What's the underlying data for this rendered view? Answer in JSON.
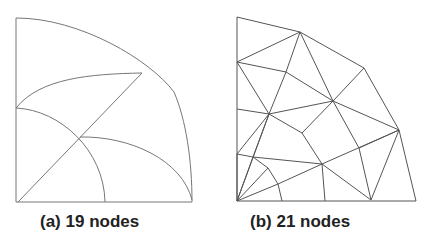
{
  "figures": [
    {
      "id": "a",
      "caption": "(a) 19 nodes",
      "type": "curved quadrant mesh",
      "stroke": "#777777",
      "lines": [
        "M16,18 L16,202",
        "M16,202 L192,202",
        "M16,18 C 80,18 150,60 174,92",
        "M174,92 C 186,120 192,160 192,202",
        "M18,202 L142,73",
        "M16,108 C 40,78 90,74 142,73",
        "M16,108 C 60,110 104,150 105,202",
        "M80,137 C 130,136 182,160 192,200"
      ]
    },
    {
      "id": "b",
      "caption": "(b) 21 nodes",
      "type": "triangular mesh",
      "stroke": "#555555",
      "nodes": {
        "A": [
          237,
          17
        ],
        "B": [
          300,
          32
        ],
        "C": [
          364,
          68
        ],
        "D": [
          399,
          130
        ],
        "E": [
          416,
          201
        ],
        "F": [
          237,
          201
        ],
        "G": [
          237,
          62
        ],
        "H": [
          286,
          72
        ],
        "I": [
          333,
          101
        ],
        "J": [
          269,
          114
        ],
        "K": [
          237,
          109
        ],
        "L": [
          302,
          133
        ],
        "M": [
          359,
          148
        ],
        "N": [
          237,
          154
        ],
        "O": [
          253,
          157
        ],
        "P": [
          268,
          168
        ],
        "Q": [
          322,
          164
        ],
        "R": [
          278,
          184
        ],
        "S": [
          282,
          201
        ],
        "T": [
          325,
          201
        ],
        "U": [
          371,
          200
        ]
      },
      "edges": [
        [
          "A",
          "B"
        ],
        [
          "B",
          "C"
        ],
        [
          "C",
          "D"
        ],
        [
          "D",
          "E"
        ],
        [
          "E",
          "F"
        ],
        [
          "F",
          "A"
        ],
        [
          "B",
          "G"
        ],
        [
          "B",
          "H"
        ],
        [
          "B",
          "I"
        ],
        [
          "G",
          "H"
        ],
        [
          "G",
          "J"
        ],
        [
          "H",
          "I"
        ],
        [
          "H",
          "J"
        ],
        [
          "C",
          "I"
        ],
        [
          "I",
          "D"
        ],
        [
          "I",
          "J"
        ],
        [
          "K",
          "J"
        ],
        [
          "J",
          "L"
        ],
        [
          "L",
          "Q"
        ],
        [
          "L",
          "I"
        ],
        [
          "I",
          "M"
        ],
        [
          "M",
          "U"
        ],
        [
          "M",
          "D"
        ],
        [
          "Q",
          "D"
        ],
        [
          "D",
          "U"
        ],
        [
          "Q",
          "U"
        ],
        [
          "Q",
          "T"
        ],
        [
          "Q",
          "O"
        ],
        [
          "Q",
          "R"
        ],
        [
          "J",
          "N"
        ],
        [
          "J",
          "O"
        ],
        [
          "J",
          "F"
        ],
        [
          "N",
          "O"
        ],
        [
          "N",
          "F"
        ],
        [
          "O",
          "P"
        ],
        [
          "P",
          "R"
        ],
        [
          "R",
          "S"
        ],
        [
          "F",
          "P"
        ],
        [
          "F",
          "R"
        ],
        [
          "F",
          "O"
        ]
      ]
    }
  ]
}
